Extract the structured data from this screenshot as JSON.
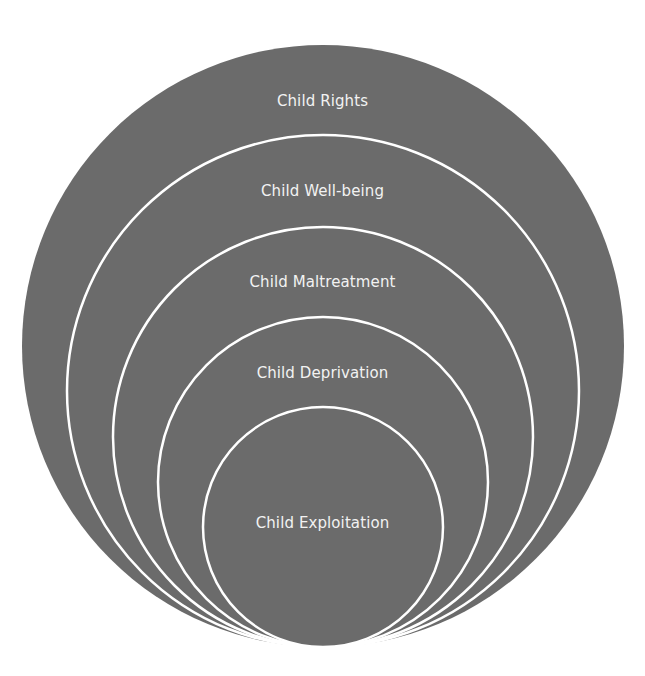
{
  "diagram": {
    "type": "nested-circles",
    "fill_color": "#6b6b6b",
    "stroke_color": "#ffffff",
    "background": "#ffffff",
    "tangent_point": {
      "x": 323,
      "y": 647
    },
    "layers": [
      {
        "label": "Child Rights",
        "cx": 323,
        "cy": 346,
        "r": 301,
        "label_y": 91
      },
      {
        "label": "Child Well-being",
        "cx": 323,
        "cy": 391,
        "r": 256,
        "label_y": 181
      },
      {
        "label": "Child Maltreatment",
        "cx": 323,
        "cy": 437,
        "r": 210,
        "label_y": 272
      },
      {
        "label": "Child Deprivation",
        "cx": 323,
        "cy": 482,
        "r": 165,
        "label_y": 363
      },
      {
        "label": "Child Exploitation",
        "cx": 323,
        "cy": 527,
        "r": 120,
        "label_y": 513
      }
    ]
  }
}
